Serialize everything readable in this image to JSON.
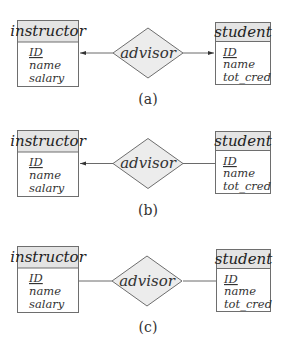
{
  "colors": {
    "border": "#6e6e6e",
    "header_fill": "#e4e4e4",
    "body_fill": "#ffffff",
    "diamond_fill": "#ececec",
    "line": "#6a6a6a",
    "arrow": "#333333"
  },
  "diagrams": [
    {
      "caption": "(a)",
      "left_entity": {
        "title": "instructor",
        "attributes": [
          "ID",
          "name",
          "salary"
        ],
        "primary_key": "ID"
      },
      "relationship": "advisor",
      "right_entity": {
        "title": "student",
        "attributes": [
          "ID",
          "name",
          "tot_cred"
        ],
        "primary_key": "ID"
      },
      "left_arrow": true,
      "right_arrow": true
    },
    {
      "caption": "(b)",
      "left_entity": {
        "title": "instructor",
        "attributes": [
          "ID",
          "name",
          "salary"
        ],
        "primary_key": "ID"
      },
      "relationship": "advisor",
      "right_entity": {
        "title": "student",
        "attributes": [
          "ID",
          "name",
          "tot_cred"
        ],
        "primary_key": "ID"
      },
      "left_arrow": true,
      "right_arrow": false
    },
    {
      "caption": "(c)",
      "left_entity": {
        "title": "instructor",
        "attributes": [
          "ID",
          "name",
          "salary"
        ],
        "primary_key": "ID"
      },
      "relationship": "advisor",
      "right_entity": {
        "title": "student",
        "attributes": [
          "ID",
          "name",
          "tot_cred"
        ],
        "primary_key": "ID"
      },
      "left_arrow": false,
      "right_arrow": false
    }
  ]
}
